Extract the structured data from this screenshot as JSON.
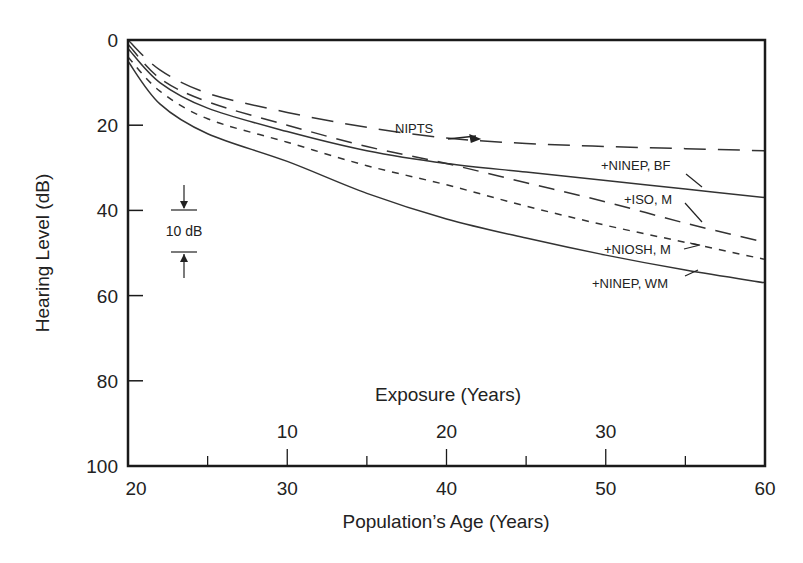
{
  "chart_data": {
    "type": "line",
    "title": "",
    "xlabel": "Population’s Age (Years)",
    "ylabel": "Hearing Level (dB)",
    "secondary_xlabel": "Exposure (Years)",
    "xlim": [
      20,
      60
    ],
    "ylim": [
      0,
      100
    ],
    "y_inverted": true,
    "grid": false,
    "legend_position": "inline labels",
    "x_ticks": [
      20,
      30,
      40,
      50,
      60
    ],
    "x_minor_ticks": [
      25,
      35,
      45,
      55
    ],
    "y_ticks": [
      0,
      20,
      40,
      60,
      80,
      100
    ],
    "secondary_x_ticks": [
      {
        "label": "10",
        "age": 30
      },
      {
        "label": "20",
        "age": 40
      },
      {
        "label": "30",
        "age": 50
      }
    ],
    "x": [
      20,
      22,
      25,
      30,
      35,
      40,
      45,
      50,
      55,
      60
    ],
    "series": [
      {
        "name": "NIPTS",
        "style": "long-dash",
        "values": [
          0,
          7,
          12.5,
          17,
          20.5,
          23,
          24.3,
          25,
          25.5,
          26
        ]
      },
      {
        "name": "+NINEP, BF",
        "style": "solid",
        "values": [
          2,
          10,
          16,
          21.5,
          26,
          29,
          31,
          33,
          35,
          37
        ]
      },
      {
        "name": "+ISO, M",
        "style": "dash",
        "values": [
          1,
          9,
          14.5,
          20,
          25,
          29,
          33.5,
          38,
          43,
          47.5
        ]
      },
      {
        "name": "+NIOSH, M",
        "style": "short-dash",
        "values": [
          4,
          12,
          18.5,
          24,
          29.5,
          34,
          39,
          43.5,
          47.5,
          51.5
        ]
      },
      {
        "name": "+NINEP, WM",
        "style": "solid",
        "values": [
          5,
          15,
          22,
          28.5,
          36,
          42,
          46.5,
          50.5,
          54,
          57
        ]
      }
    ],
    "annotations": [
      {
        "text": "NIPTS",
        "note": "arrow pointing to NIPTS curve near age 42"
      },
      {
        "text": "10 dB",
        "note": "scale bar showing 10 dB span between 40 and 50 dB"
      }
    ]
  },
  "labels": {
    "nipts": "NIPTS",
    "ninep_bf": "+NINEP, BF",
    "iso_m": "+ISO, M",
    "niosh_m": "+NIOSH, M",
    "ninep_wm": "+NINEP, WM",
    "scale": "10 dB"
  },
  "colors": {
    "axis": "#1a1a1a",
    "line": "#333333",
    "text": "#222222",
    "background": "#ffffff"
  }
}
